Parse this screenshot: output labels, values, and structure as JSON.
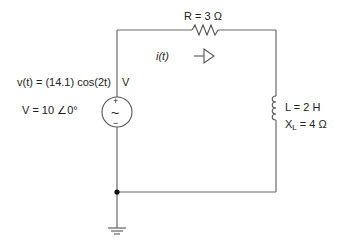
{
  "diagram": {
    "type": "circuit-schematic",
    "source": {
      "label_vt": "v(t) = (14.1) cos(2t)",
      "unit_v": "V",
      "label_phasor": "V = 10 ∠0°",
      "plus": "+",
      "minus": "−",
      "symbol": "~"
    },
    "resistor": {
      "label": "R = 3 Ω"
    },
    "current": {
      "label": "i(t)"
    },
    "inductor": {
      "label_L": "L = 2 H",
      "label_XL_name": "X",
      "label_XL_sub": "L",
      "label_XL_value": " = 4 Ω"
    },
    "ground": {
      "name": "ground"
    }
  }
}
